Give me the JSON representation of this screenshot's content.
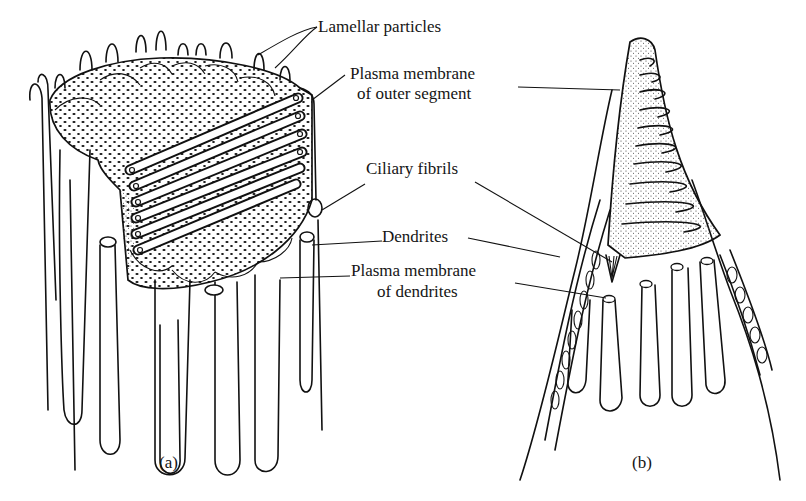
{
  "figure": {
    "panels": [
      {
        "id": "a",
        "caption": "(a)",
        "description": "Outer segment of a ciliary photoreceptor with stacked lamellae and surrounding dendrites"
      },
      {
        "id": "b",
        "caption": "(b)",
        "description": "Cone-shaped outer segment with folded membrane lamellae and dendrites"
      }
    ],
    "labels": {
      "lamellar_particles": "Lamellar particles",
      "plasma_membrane_outer_1": "Plasma membrane",
      "plasma_membrane_outer_2": "of outer segment",
      "ciliary_fibrils": "Ciliary fibrils",
      "dendrites": "Dendrites",
      "plasma_membrane_dendrites_1": "Plasma membrane",
      "plasma_membrane_dendrites_2": "of dendrites"
    },
    "colors": {
      "ink": "#111111",
      "background": "#ffffff"
    }
  }
}
